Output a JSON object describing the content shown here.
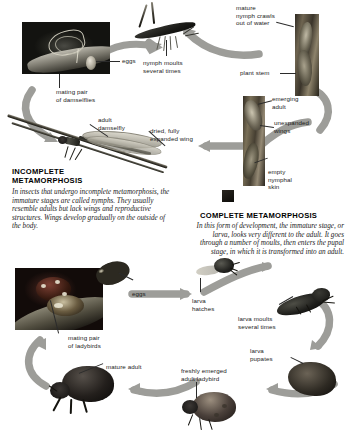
{
  "figure": {
    "background_color": "#ffffff",
    "arrow_color": "#9a9a96",
    "text_color": "#1a1a1a"
  },
  "sections": [
    {
      "id": "incomplete",
      "heading": "INCOMPLETE\nMETAMORPHOSIS",
      "body": "In insects that undergo incomplete metamorphosis, the immature stages are called nymphs. They usually resemble adults but lack wings and reproductive structures. Wings develop gradually on the outside of the body."
    },
    {
      "id": "complete",
      "heading": "COMPLETE METAMORPHOSIS",
      "body": "In this form of development, the immature stage, or larva, looks very different to the adult. It goes through a number of moults, then enters the pupal stage, in which it is transformed into an adult."
    }
  ],
  "labels": {
    "eggs_damselfly": "eggs",
    "mating_pair_damselflies": "mating pair\nof damselflies",
    "nymph_moults": "nymph moults\nseveral times",
    "mature_nymph": "mature\nnymph crawls\nout of water",
    "plant_stem": "plant stem",
    "emerging_adult": "emerging\nadult",
    "unexpanded_wings": "unexpanded\nwings",
    "empty_nymphal_skin": "empty\nnymphal\nskin",
    "adult_damselfly": "adult\ndamselfly",
    "dried_expanded_wing": "dried, fully\nexpanded wing",
    "eggs_ladybird": "eggs",
    "larva_hatches": "larva\nhatches",
    "larva_moults": "larva moults\nseveral times",
    "larva_pupates": "larva\npupates",
    "freshly_emerged_adult": "freshly emerged\nadult ladybird",
    "mature_adult": "mature adult",
    "mating_pair_ladybirds": "mating pair\nof ladybirds"
  }
}
